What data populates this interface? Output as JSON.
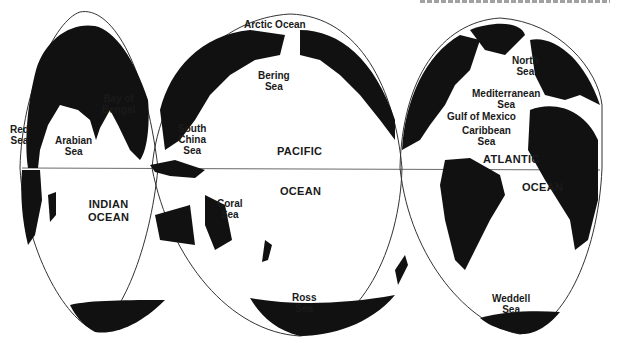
{
  "figure": {
    "caption_note": "Top caption is cropped and illegible"
  },
  "oceans": [
    {
      "id": "arctic",
      "lines": [
        "Arctic Ocean"
      ]
    },
    {
      "id": "pacific",
      "lines": [
        "PACIFIC"
      ]
    },
    {
      "id": "pacific2",
      "lines": [
        "OCEAN"
      ]
    },
    {
      "id": "indian",
      "lines": [
        "INDIAN",
        "OCEAN"
      ]
    },
    {
      "id": "atlantic",
      "lines": [
        "ATLANTIC"
      ]
    },
    {
      "id": "atlantic2",
      "lines": [
        "OCEAN"
      ]
    }
  ],
  "seas": [
    {
      "id": "red",
      "lines": [
        "Red",
        "Sea"
      ]
    },
    {
      "id": "arabian",
      "lines": [
        "Arabian",
        "Sea"
      ]
    },
    {
      "id": "bengal",
      "lines": [
        "Bay of",
        "Bengal"
      ]
    },
    {
      "id": "south-china",
      "lines": [
        "South",
        "China",
        "Sea"
      ]
    },
    {
      "id": "bering",
      "lines": [
        "Bering",
        "Sea"
      ]
    },
    {
      "id": "coral",
      "lines": [
        "Coral",
        "Sea"
      ]
    },
    {
      "id": "ross",
      "lines": [
        "Ross",
        "Sea"
      ]
    },
    {
      "id": "north",
      "lines": [
        "North",
        "Sea"
      ]
    },
    {
      "id": "mediterranean",
      "lines": [
        "Mediterranean",
        "Sea"
      ]
    },
    {
      "id": "gulf-mexico",
      "lines": [
        "Gulf of Mexico"
      ]
    },
    {
      "id": "caribbean",
      "lines": [
        "Caribbean",
        "Sea"
      ]
    },
    {
      "id": "weddell",
      "lines": [
        "Weddell",
        "Sea"
      ]
    }
  ],
  "colors": {
    "land": "#111111",
    "water": "#ffffff",
    "outline": "#333333"
  }
}
